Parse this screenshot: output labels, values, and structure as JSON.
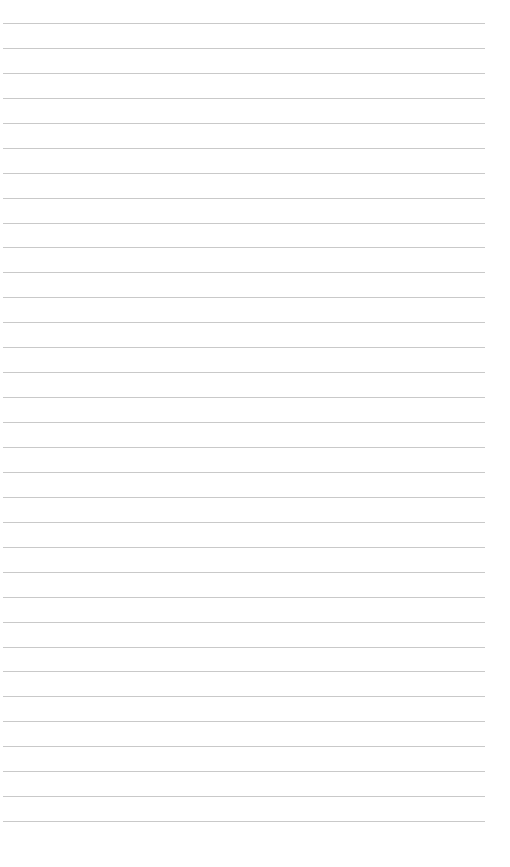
{
  "page": {
    "type": "lined-paper",
    "background_color": "#ffffff",
    "rule_color": "#bfbfbf",
    "rule_count": 33,
    "first_rule_y": 23,
    "rule_spacing": 24.94,
    "rule_left": 3,
    "rule_width": 482,
    "text": []
  }
}
